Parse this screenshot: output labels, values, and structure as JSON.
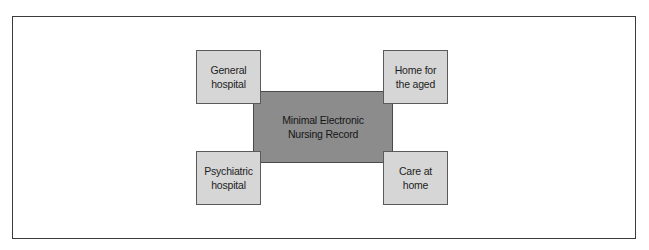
{
  "diagram": {
    "center": {
      "label": "Minimal Electronic\nNursing Record",
      "fill": "#8c8c8c"
    },
    "nodes": [
      {
        "position": "top-left",
        "label": "General\nhospital"
      },
      {
        "position": "top-right",
        "label": "Home for\nthe aged"
      },
      {
        "position": "bottom-left",
        "label": "Psychiatric\nhospital"
      },
      {
        "position": "bottom-right",
        "label": "Care at\nhome"
      }
    ],
    "node_fill": "#d6d6d6",
    "frame_border": "#3a3a3a"
  }
}
